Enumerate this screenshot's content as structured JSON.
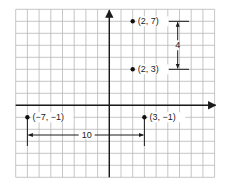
{
  "diagram": {
    "type": "coordinate-plane",
    "grid": {
      "x_min": -8,
      "x_max": 9,
      "y_min": -6,
      "y_max": 8,
      "origin_px": [
        109.3,
        105.3
      ],
      "cell_w": 11.7,
      "cell_h": 12,
      "line_color": "#b8b8b8",
      "axis_color": "#1a1a1a"
    },
    "points": [
      {
        "id": "p1",
        "x": 2,
        "y": 7,
        "label": "(2, 7)"
      },
      {
        "id": "p2",
        "x": 2,
        "y": 3,
        "label": "(2, 3)"
      },
      {
        "id": "p3",
        "x": -7,
        "y": -1,
        "label": "(−7, −1)"
      },
      {
        "id": "p4",
        "x": 3,
        "y": -1,
        "label": "(3, −1)"
      }
    ],
    "vertical_distance": {
      "label": "4",
      "from": [
        2,
        7
      ],
      "to": [
        2,
        3
      ]
    },
    "horizontal_distance": {
      "label": "10",
      "from": [
        -7,
        -1
      ],
      "to": [
        3,
        -1
      ]
    }
  }
}
